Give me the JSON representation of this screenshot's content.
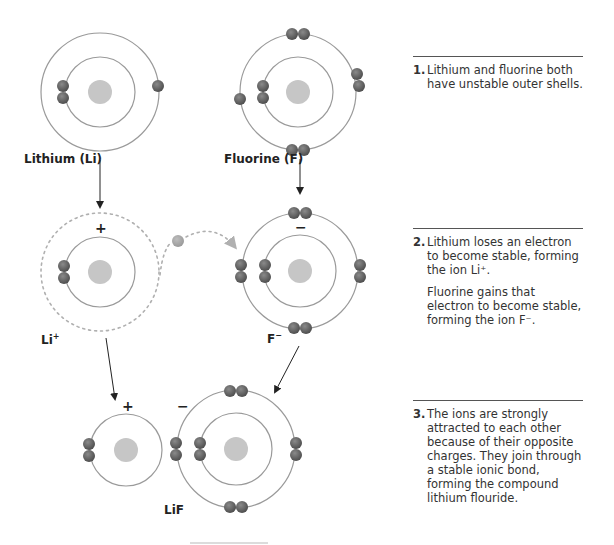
{
  "colors": {
    "orbit": "#9a9a9a",
    "nucleus": "#c6c6c6",
    "electron": "#5e5e5e",
    "electron_light": "#a8a8a8",
    "dashed": "#b0b0b0",
    "text": "#222222",
    "rule": "#555555"
  },
  "labels": {
    "lithium": "Lithium (Li)",
    "fluorine": "Fluorine (F)",
    "li_ion": "Li",
    "li_ion_charge": "+",
    "f_ion": "F",
    "f_ion_charge": "−",
    "compound": "LiF"
  },
  "signs": {
    "li_plus": "+",
    "f_minus": "−",
    "lif_plus": "+",
    "lif_minus": "−"
  },
  "steps": [
    {
      "number": "1.",
      "paragraphs": [
        "Lithium and fluorine both have unstable outer shells."
      ]
    },
    {
      "number": "2.",
      "paragraphs": [
        "Lithium loses an electron to become stable, forming the ion Li⁺.",
        "Fluorine gains that electron to become stable, forming the ion F⁻."
      ]
    },
    {
      "number": "3.",
      "paragraphs": [
        "The ions are strongly attracted to each other because of their opposite charges. They join through a stable ionic bond, forming the compound lithium flouride."
      ]
    }
  ]
}
